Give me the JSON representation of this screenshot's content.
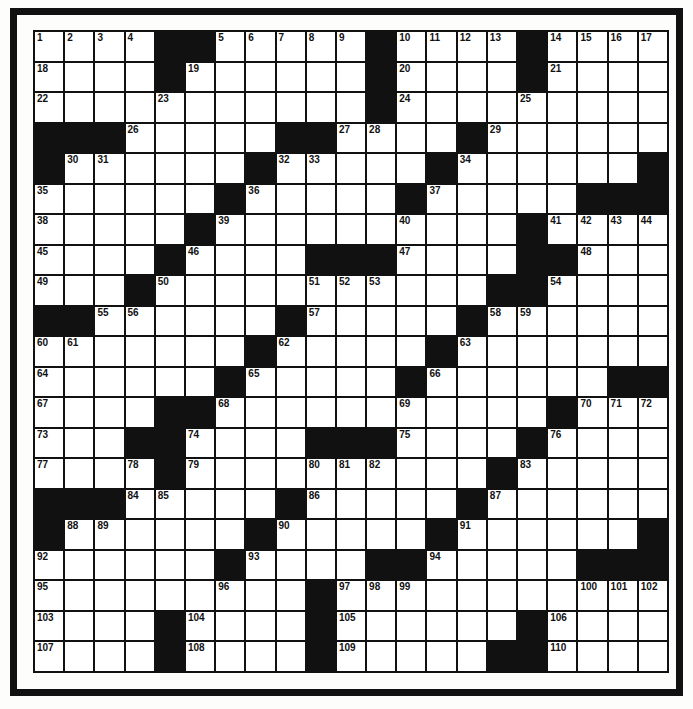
{
  "puzzle": {
    "rows": 21,
    "cols": 21,
    "grid": [
      [
        "1",
        "2",
        "3",
        "4",
        "#",
        "#",
        "5",
        "6",
        "7",
        "8",
        "9",
        "#",
        "10",
        "11",
        "12",
        "13",
        "#",
        "14",
        "15",
        "16",
        "17"
      ],
      [
        "18",
        ".",
        ".",
        ".",
        "#",
        "19",
        ".",
        ".",
        ".",
        ".",
        ".",
        "#",
        "20",
        ".",
        ".",
        ".",
        "#",
        "21",
        ".",
        ".",
        "."
      ],
      [
        "22",
        ".",
        ".",
        ".",
        "23",
        ".",
        ".",
        ".",
        ".",
        ".",
        ".",
        "#",
        "24",
        ".",
        ".",
        ".",
        "25",
        ".",
        ".",
        ".",
        "."
      ],
      [
        "#",
        "#",
        "#",
        "26",
        ".",
        ".",
        ".",
        ".",
        "#",
        "#",
        "27",
        "28",
        ".",
        ".",
        "#",
        "29",
        ".",
        ".",
        ".",
        ".",
        "."
      ],
      [
        "#",
        "30",
        "31",
        ".",
        ".",
        ".",
        ".",
        "#",
        "32",
        "33",
        ".",
        ".",
        ".",
        "#",
        "34",
        ".",
        ".",
        ".",
        ".",
        ".",
        "#"
      ],
      [
        "35",
        ".",
        ".",
        ".",
        ".",
        ".",
        "#",
        "36",
        ".",
        ".",
        ".",
        ".",
        "#",
        "37",
        ".",
        ".",
        ".",
        ".",
        "#",
        "#",
        "#"
      ],
      [
        "38",
        ".",
        ".",
        ".",
        ".",
        "#",
        "39",
        ".",
        ".",
        ".",
        ".",
        ".",
        "40",
        ".",
        ".",
        ".",
        "#",
        "41",
        "42",
        "43",
        "44"
      ],
      [
        "45",
        ".",
        ".",
        ".",
        "#",
        "46",
        ".",
        ".",
        ".",
        "#",
        "#",
        "#",
        "47",
        ".",
        ".",
        ".",
        "#",
        "#",
        "48",
        ".",
        "."
      ],
      [
        "49",
        ".",
        ".",
        "#",
        "50",
        ".",
        ".",
        ".",
        ".",
        "51",
        "52",
        "53",
        ".",
        ".",
        ".",
        "#",
        "#",
        "54",
        ".",
        ".",
        "."
      ],
      [
        "#",
        "#",
        "55",
        "56",
        ".",
        ".",
        ".",
        ".",
        "#",
        "57",
        ".",
        ".",
        ".",
        ".",
        "#",
        "58",
        "59",
        ".",
        ".",
        ".",
        "."
      ],
      [
        "60",
        "61",
        ".",
        ".",
        ".",
        ".",
        ".",
        "#",
        "62",
        ".",
        ".",
        ".",
        ".",
        "#",
        "63",
        ".",
        ".",
        ".",
        ".",
        ".",
        "."
      ],
      [
        "64",
        ".",
        ".",
        ".",
        ".",
        ".",
        "#",
        "65",
        ".",
        ".",
        ".",
        ".",
        "#",
        "66",
        ".",
        ".",
        ".",
        ".",
        ".",
        "#",
        "#"
      ],
      [
        "67",
        ".",
        ".",
        ".",
        "#",
        "#",
        "68",
        ".",
        ".",
        ".",
        ".",
        ".",
        "69",
        ".",
        ".",
        ".",
        ".",
        "#",
        "70",
        "71",
        "72"
      ],
      [
        "73",
        ".",
        ".",
        "#",
        "#",
        "74",
        ".",
        ".",
        ".",
        "#",
        "#",
        "#",
        "75",
        ".",
        ".",
        ".",
        "#",
        "76",
        ".",
        ".",
        "."
      ],
      [
        "77",
        ".",
        ".",
        "78",
        "#",
        "79",
        ".",
        ".",
        ".",
        "80",
        "81",
        "82",
        ".",
        ".",
        ".",
        "#",
        "83",
        ".",
        ".",
        ".",
        "."
      ],
      [
        "#",
        "#",
        "#",
        "84",
        "85",
        ".",
        ".",
        ".",
        "#",
        "86",
        ".",
        ".",
        ".",
        ".",
        "#",
        "87",
        ".",
        ".",
        ".",
        ".",
        "."
      ],
      [
        "#",
        "88",
        "89",
        ".",
        ".",
        ".",
        ".",
        "#",
        "90",
        ".",
        ".",
        ".",
        ".",
        "#",
        "91",
        ".",
        ".",
        ".",
        ".",
        ".",
        "#"
      ],
      [
        "92",
        ".",
        ".",
        ".",
        ".",
        ".",
        "#",
        "93",
        ".",
        ".",
        ".",
        "#",
        "#",
        "94",
        ".",
        ".",
        ".",
        ".",
        "#",
        "#",
        "#"
      ],
      [
        "95",
        ".",
        ".",
        ".",
        ".",
        ".",
        "96",
        ".",
        ".",
        "#",
        "97",
        "98",
        "99",
        ".",
        ".",
        ".",
        ".",
        ".",
        "100",
        "101",
        "102"
      ],
      [
        "103",
        ".",
        ".",
        ".",
        "#",
        "104",
        ".",
        ".",
        ".",
        "#",
        "105",
        ".",
        ".",
        ".",
        ".",
        ".",
        "#",
        "106",
        ".",
        ".",
        "."
      ],
      [
        "107",
        ".",
        ".",
        ".",
        "#",
        "108",
        ".",
        ".",
        ".",
        "#",
        "109",
        ".",
        ".",
        ".",
        ".",
        "#",
        "#",
        "110",
        ".",
        ".",
        "."
      ]
    ]
  },
  "colors": {
    "black": "#111111",
    "white": "#ffffff",
    "paper": "#fdfdfb"
  }
}
